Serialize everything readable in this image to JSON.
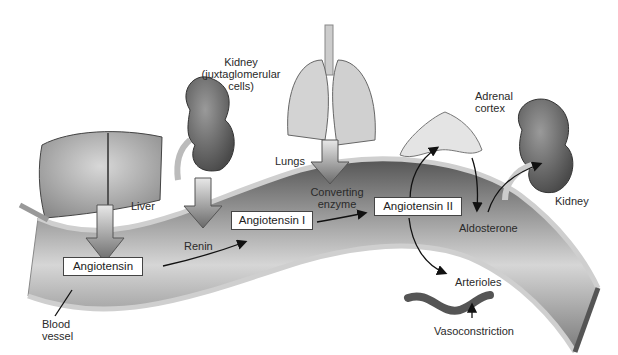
{
  "diagram": {
    "organs": {
      "kidney_top": "Kidney",
      "kidney_top_sub1": "(juxtaglomerular",
      "kidney_top_sub2": "cells)",
      "lungs": "Lungs",
      "adrenal1": "Adrenal",
      "adrenal2": "cortex",
      "liver": "Liver",
      "kidney_right": "Kidney",
      "blood1": "Blood",
      "blood2": "vessel",
      "arterioles": "Arterioles"
    },
    "molecules": {
      "angiotensin": "Angiotensin",
      "angiotensin_1": "Angiotensin I",
      "angiotensin_2": "Angiotensin II"
    },
    "agents": {
      "renin": "Renin",
      "converting1": "Converting",
      "converting2": "enzyme",
      "aldosterone": "Aldosterone",
      "vasoconstriction": "Vasoconstriction"
    },
    "colors": {
      "vessel_dark": "#5e5e5e",
      "vessel_light": "#c8c8c8",
      "organ_gray": "#7a7a7a",
      "arrow_fill": "#9a9a9a"
    }
  }
}
